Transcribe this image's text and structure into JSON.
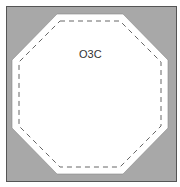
{
  "diagram": {
    "label": "O3C",
    "colors": {
      "background": "#a8a8a8",
      "frame_border": "#555555",
      "octagon_fill": "#ffffff",
      "dash_stroke": "#666666"
    }
  }
}
